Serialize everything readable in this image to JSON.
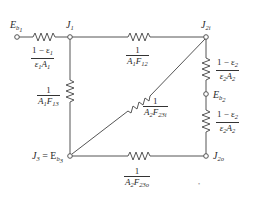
{
  "diagram": {
    "type": "radiation network circuit",
    "nodes": {
      "Eb1": {
        "label_main": "E",
        "label_sub": "b",
        "label_subsub": "1"
      },
      "J1": {
        "label_main": "J",
        "label_sub": "1"
      },
      "J2i": {
        "label_main": "J",
        "label_sub": "2i"
      },
      "Eb2": {
        "label_main": "E",
        "label_sub": "b",
        "label_subsub": "2"
      },
      "J2o": {
        "label_main": "J",
        "label_sub": "2o"
      },
      "J3": {
        "label_main": "J",
        "label_sub": "3",
        "eq": " = E",
        "eq_sub": "b",
        "eq_subsub": "3"
      }
    },
    "resistances": {
      "surface1": {
        "num": "1 − ε",
        "num_sub": "1",
        "den_a": "ε",
        "den_a_sub": "1",
        "den_b": "A",
        "den_b_sub": "1"
      },
      "space12": {
        "num": "1",
        "den_a": "A",
        "den_a_sub": "1",
        "den_b": "F",
        "den_b_sub": "12"
      },
      "space13": {
        "num": "1",
        "den_a": "A",
        "den_a_sub": "1",
        "den_b": "F",
        "den_b_sub": "13"
      },
      "space23i": {
        "num": "1",
        "den_a": "A",
        "den_a_sub": "2",
        "den_b": "F",
        "den_b_sub": "23i"
      },
      "surface2_upper": {
        "num": "1 − ε",
        "num_sub": "2",
        "den_a": "ε",
        "den_a_sub": "2",
        "den_b": "A",
        "den_b_sub": "2"
      },
      "surface2_lower": {
        "num": "1 − ε",
        "num_sub": "2",
        "den_a": "ε",
        "den_a_sub": "2",
        "den_b": "A",
        "den_b_sub": "2"
      },
      "space23o": {
        "num": "1",
        "den_a": "A",
        "den_a_sub": "2",
        "den_b": "F",
        "den_b_sub": "23o"
      }
    },
    "stray_mark": "•",
    "colors": {
      "line": "#555555",
      "text": "#2a2a2a",
      "background": "#ffffff"
    }
  }
}
